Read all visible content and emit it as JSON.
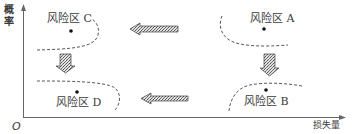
{
  "diagram": {
    "axes": {
      "y_label": "概率",
      "x_label": "损失量",
      "origin": "O"
    },
    "zones": [
      {
        "id": "C",
        "label": "风险区 C"
      },
      {
        "id": "A",
        "label": "风险区 A"
      },
      {
        "id": "D",
        "label": "风险区 D"
      },
      {
        "id": "B",
        "label": "风险区 B"
      }
    ],
    "arrows": [
      {
        "from": "A",
        "to": "C",
        "direction": "left"
      },
      {
        "from": "B",
        "to": "D",
        "direction": "left"
      },
      {
        "from": "C",
        "to": "D",
        "direction": "down"
      },
      {
        "from": "A",
        "to": "B",
        "direction": "down"
      }
    ],
    "colors": {
      "axis": "#666666",
      "curve": "#444444",
      "arrow_fill": "#bbbbbb",
      "text": "#3a3a3a"
    }
  }
}
